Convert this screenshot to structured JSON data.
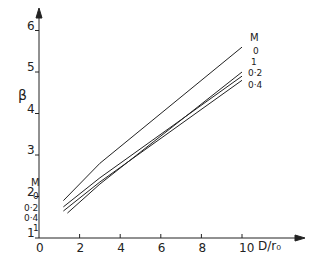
{
  "chart_data": {
    "type": "line",
    "title": "",
    "xlabel": "D/r₀",
    "ylabel": "β",
    "xlim": [
      0,
      11
    ],
    "ylim": [
      1,
      6.2
    ],
    "xticks": [
      0,
      2,
      4,
      6,
      8,
      10
    ],
    "yticks": [
      1,
      2,
      3,
      4,
      5,
      6
    ],
    "legend_title": "M",
    "grid": false,
    "series": [
      {
        "name": "0",
        "x": [
          1.2,
          3,
          10
        ],
        "y": [
          1.9,
          2.8,
          5.6
        ]
      },
      {
        "name": "0·2",
        "x": [
          1.2,
          3,
          10
        ],
        "y": [
          1.75,
          2.45,
          4.9
        ]
      },
      {
        "name": "0·4",
        "x": [
          1.2,
          3,
          10
        ],
        "y": [
          1.65,
          2.35,
          4.8
        ]
      },
      {
        "name": "1",
        "x": [
          1.4,
          3,
          10
        ],
        "y": [
          1.6,
          2.3,
          5.0
        ]
      }
    ]
  }
}
